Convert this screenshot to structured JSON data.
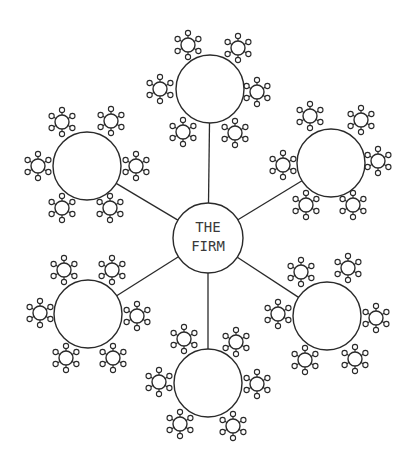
{
  "diagram": {
    "colors": {
      "stroke": "#2a2a2a",
      "background": "#ffffff",
      "text": "#3a3a3a"
    },
    "hub": {
      "label_lines": [
        "THE",
        "FIRM"
      ],
      "cx": 208,
      "cy": 238,
      "r": 35
    },
    "satellite_style": {
      "r": 7,
      "spoke_length": 12,
      "tip_r": 2.6,
      "spoke_angles_deg": [
        30,
        90,
        150,
        210,
        270,
        330
      ]
    },
    "nodes": [
      {
        "id": "top",
        "cx": 210,
        "cy": 89,
        "r": 34,
        "satellites": [
          [
            188,
            45
          ],
          [
            238,
            48
          ],
          [
            160,
            89
          ],
          [
            257,
            92
          ],
          [
            183,
            132
          ],
          [
            235,
            133
          ]
        ]
      },
      {
        "id": "upper-left",
        "cx": 87,
        "cy": 166,
        "r": 34,
        "satellites": [
          [
            62,
            122
          ],
          [
            111,
            121
          ],
          [
            38,
            166
          ],
          [
            136,
            166
          ],
          [
            62,
            208
          ],
          [
            110,
            208
          ]
        ]
      },
      {
        "id": "upper-right",
        "cx": 331,
        "cy": 163,
        "r": 34,
        "satellites": [
          [
            310,
            116
          ],
          [
            361,
            120
          ],
          [
            283,
            165
          ],
          [
            378,
            161
          ],
          [
            306,
            205
          ],
          [
            353,
            205
          ]
        ]
      },
      {
        "id": "lower-left",
        "cx": 88,
        "cy": 314,
        "r": 34,
        "satellites": [
          [
            64,
            270
          ],
          [
            112,
            270
          ],
          [
            40,
            313
          ],
          [
            137,
            316
          ],
          [
            66,
            358
          ],
          [
            113,
            358
          ]
        ]
      },
      {
        "id": "lower-right",
        "cx": 327,
        "cy": 316,
        "r": 34,
        "satellites": [
          [
            301,
            272
          ],
          [
            348,
            268
          ],
          [
            278,
            314
          ],
          [
            376,
            318
          ],
          [
            305,
            360
          ],
          [
            355,
            359
          ]
        ]
      },
      {
        "id": "bottom",
        "cx": 208,
        "cy": 383,
        "r": 34,
        "satellites": [
          [
            184,
            339
          ],
          [
            236,
            342
          ],
          [
            159,
            382
          ],
          [
            257,
            384
          ],
          [
            180,
            424
          ],
          [
            233,
            426
          ]
        ]
      }
    ]
  }
}
